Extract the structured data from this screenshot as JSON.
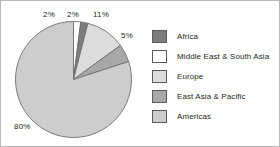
{
  "chart_data": {
    "type": "pie",
    "title": "",
    "legend_position": "right",
    "categories": [
      "Africa",
      "Middle East & South Asia",
      "Europe",
      "East Asia & Pacific",
      "Americas"
    ],
    "values": [
      2,
      2,
      11,
      5,
      80
    ],
    "value_labels": [
      "2%",
      "2%",
      "11%",
      "5%",
      "80%"
    ],
    "units": "percent",
    "total": 100,
    "slice_order_clockwise_from_top": [
      "Middle East & South Asia",
      "Africa",
      "Europe",
      "East Asia & Pacific",
      "Americas"
    ],
    "colors": [
      "#7d7d7d",
      "#ffffff",
      "#dcdcdc",
      "#a8a8a8",
      "#cdcdcd"
    ],
    "slices": [
      {
        "name": "Middle East & South Asia",
        "value": 2,
        "label": "2%",
        "color": "#ffffff"
      },
      {
        "name": "Africa",
        "value": 2,
        "label": "2%",
        "color": "#7d7d7d"
      },
      {
        "name": "Europe",
        "value": 11,
        "label": "11%",
        "color": "#dcdcdc"
      },
      {
        "name": "East Asia & Pacific",
        "value": 5,
        "label": "5%",
        "color": "#a8a8a8"
      },
      {
        "name": "Americas",
        "value": 80,
        "label": "80%",
        "color": "#cdcdcd"
      }
    ]
  },
  "legend": {
    "items": [
      {
        "label": "Africa",
        "color": "#7d7d7d"
      },
      {
        "label": "Middle East & South Asia",
        "color": "#ffffff"
      },
      {
        "label": "Europe",
        "color": "#dcdcdc"
      },
      {
        "label": "East Asia & Pacific",
        "color": "#a8a8a8"
      },
      {
        "label": "Americas",
        "color": "#cdcdcd"
      }
    ]
  }
}
